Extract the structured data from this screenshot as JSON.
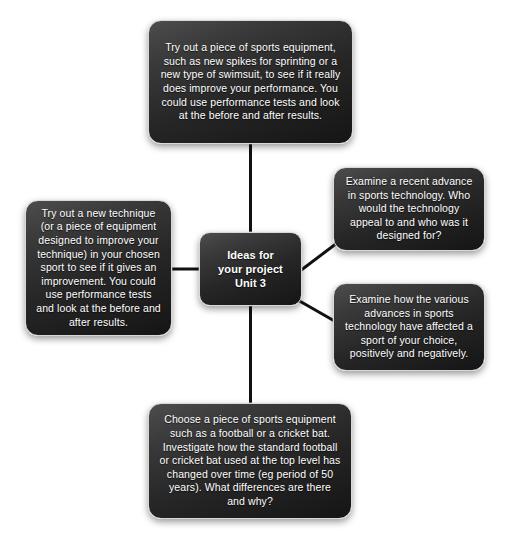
{
  "diagram": {
    "title": "Ideas for your project Unit 3",
    "type": "mind-map",
    "colors": {
      "background": "#ffffff",
      "node_fill_light": "#4d4d4d",
      "node_fill_dark": "#151515",
      "node_border": "#d8d8d8",
      "node_text": "#ffffff",
      "edge": "#111111"
    },
    "center": {
      "id": "center",
      "label": "Ideas for\nyour project\nUnit 3",
      "line1": "Ideas for",
      "line2": "your project",
      "line3": "Unit 3"
    },
    "nodes": [
      {
        "id": "top",
        "position": "top",
        "text": "Try out a piece of sports equipment, such as new spikes for sprinting or a new type of swimsuit, to see if it really does improve your performance. You could use performance tests and look at the before and after results."
      },
      {
        "id": "right-upper",
        "position": "right-upper",
        "text": "Examine a recent advance in sports technology. Who would the technology appeal to and who was it designed for?"
      },
      {
        "id": "right-lower",
        "position": "right-lower",
        "text": "Examine how the various advances in sports technology have affected a sport of your choice, positively and negatively."
      },
      {
        "id": "left",
        "position": "left",
        "text": "Try out a new technique (or a piece of equipment designed to improve your technique) in your chosen sport to see if it gives an improvement. You could use performance tests and look at the before and after results."
      },
      {
        "id": "bottom",
        "position": "bottom",
        "text": "Choose a piece of sports equipment such as a football or a cricket bat. Investigate how the standard football or cricket bat used at the top level has changed over time (eg period of 50 years). What differences are there and why?"
      }
    ],
    "edges": [
      {
        "from": "center",
        "to": "top",
        "style": "straight-vertical"
      },
      {
        "from": "center",
        "to": "right-upper",
        "style": "diagonal"
      },
      {
        "from": "center",
        "to": "right-lower",
        "style": "diagonal"
      },
      {
        "from": "center",
        "to": "left",
        "style": "straight-horizontal"
      },
      {
        "from": "center",
        "to": "bottom",
        "style": "straight-vertical"
      }
    ]
  }
}
